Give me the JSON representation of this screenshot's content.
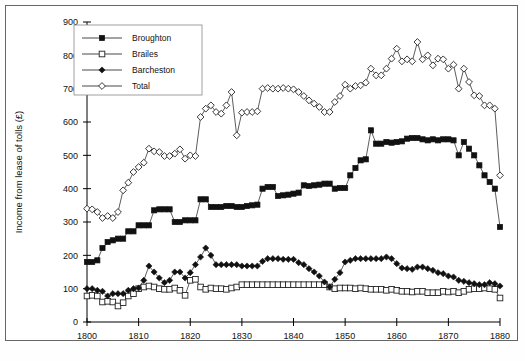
{
  "chart_data": {
    "type": "line",
    "title": "",
    "xlabel": "",
    "ylabel": "Income from lease of tolls (£)",
    "xlim": [
      1800,
      1880
    ],
    "ylim": [
      0,
      900
    ],
    "xticks": [
      1800,
      1810,
      1820,
      1830,
      1840,
      1850,
      1860,
      1870,
      1880
    ],
    "yticks": [
      0,
      100,
      200,
      300,
      400,
      500,
      600,
      700,
      800,
      900
    ],
    "grid": false,
    "legend_position": "top-left",
    "legend": [
      "Broughton",
      "Brailes",
      "Barcheston",
      "Total"
    ],
    "series": [
      {
        "name": "Broughton",
        "marker": "filled-square",
        "x": [
          1800,
          1801,
          1802,
          1803,
          1804,
          1805,
          1806,
          1807,
          1808,
          1809,
          1810,
          1811,
          1812,
          1813,
          1814,
          1815,
          1816,
          1817,
          1818,
          1819,
          1820,
          1821,
          1822,
          1823,
          1824,
          1825,
          1826,
          1827,
          1828,
          1829,
          1830,
          1831,
          1832,
          1833,
          1834,
          1835,
          1836,
          1837,
          1838,
          1839,
          1840,
          1841,
          1842,
          1843,
          1844,
          1845,
          1846,
          1847,
          1848,
          1849,
          1850,
          1851,
          1852,
          1853,
          1854,
          1855,
          1856,
          1857,
          1858,
          1859,
          1860,
          1861,
          1862,
          1863,
          1864,
          1865,
          1866,
          1867,
          1868,
          1869,
          1870,
          1871,
          1872,
          1873,
          1874,
          1875,
          1876,
          1877,
          1878,
          1879,
          1880
        ],
        "y": [
          180,
          180,
          185,
          222,
          240,
          245,
          250,
          250,
          272,
          272,
          290,
          290,
          290,
          335,
          338,
          338,
          338,
          300,
          300,
          305,
          305,
          305,
          368,
          368,
          345,
          345,
          345,
          348,
          348,
          345,
          345,
          348,
          350,
          352,
          400,
          405,
          405,
          378,
          380,
          382,
          385,
          388,
          410,
          408,
          410,
          412,
          415,
          415,
          400,
          402,
          402,
          440,
          462,
          485,
          488,
          575,
          535,
          535,
          540,
          538,
          540,
          542,
          550,
          552,
          552,
          548,
          545,
          548,
          545,
          548,
          548,
          545,
          500,
          540,
          520,
          500,
          470,
          440,
          420,
          400,
          285
        ]
      },
      {
        "name": "Brailes",
        "marker": "open-square",
        "x": [
          1800,
          1801,
          1802,
          1803,
          1804,
          1805,
          1806,
          1807,
          1808,
          1809,
          1810,
          1811,
          1812,
          1813,
          1814,
          1815,
          1816,
          1817,
          1818,
          1819,
          1820,
          1821,
          1822,
          1823,
          1824,
          1825,
          1826,
          1827,
          1828,
          1829,
          1830,
          1831,
          1832,
          1833,
          1834,
          1835,
          1836,
          1837,
          1838,
          1839,
          1840,
          1841,
          1842,
          1843,
          1844,
          1845,
          1846,
          1847,
          1848,
          1849,
          1850,
          1851,
          1852,
          1853,
          1854,
          1855,
          1856,
          1857,
          1858,
          1859,
          1860,
          1861,
          1862,
          1863,
          1864,
          1865,
          1866,
          1867,
          1868,
          1869,
          1870,
          1871,
          1872,
          1873,
          1874,
          1875,
          1876,
          1877,
          1878,
          1879,
          1880
        ],
        "y": [
          78,
          80,
          78,
          60,
          62,
          60,
          48,
          58,
          78,
          85,
          100,
          105,
          108,
          105,
          100,
          98,
          98,
          102,
          95,
          80,
          125,
          128,
          105,
          98,
          102,
          100,
          100,
          98,
          102,
          105,
          112,
          112,
          112,
          112,
          112,
          112,
          112,
          112,
          112,
          112,
          112,
          112,
          112,
          112,
          112,
          112,
          112,
          105,
          100,
          102,
          102,
          102,
          100,
          102,
          100,
          98,
          98,
          98,
          95,
          98,
          95,
          92,
          92,
          90,
          92,
          92,
          88,
          88,
          88,
          92,
          90,
          92,
          88,
          92,
          98,
          100,
          100,
          102,
          100,
          98,
          72
        ]
      },
      {
        "name": "Barcheston",
        "marker": "filled-diamond",
        "x": [
          1800,
          1801,
          1802,
          1803,
          1804,
          1805,
          1806,
          1807,
          1808,
          1809,
          1810,
          1811,
          1812,
          1813,
          1814,
          1815,
          1816,
          1817,
          1818,
          1819,
          1820,
          1821,
          1822,
          1823,
          1824,
          1825,
          1826,
          1827,
          1828,
          1829,
          1830,
          1831,
          1832,
          1833,
          1834,
          1835,
          1836,
          1837,
          1838,
          1839,
          1840,
          1841,
          1842,
          1843,
          1844,
          1845,
          1846,
          1847,
          1848,
          1849,
          1850,
          1851,
          1852,
          1853,
          1854,
          1855,
          1856,
          1857,
          1858,
          1859,
          1860,
          1861,
          1862,
          1863,
          1864,
          1865,
          1866,
          1867,
          1868,
          1869,
          1870,
          1871,
          1872,
          1873,
          1874,
          1875,
          1876,
          1877,
          1878,
          1879,
          1880
        ],
        "y": [
          100,
          100,
          95,
          92,
          78,
          85,
          85,
          85,
          95,
          100,
          102,
          125,
          168,
          150,
          132,
          118,
          125,
          150,
          150,
          132,
          148,
          172,
          195,
          222,
          200,
          172,
          172,
          172,
          172,
          172,
          168,
          168,
          168,
          168,
          182,
          190,
          190,
          190,
          188,
          188,
          188,
          178,
          172,
          160,
          150,
          138,
          120,
          105,
          128,
          148,
          180,
          185,
          190,
          190,
          190,
          190,
          190,
          190,
          195,
          190,
          175,
          162,
          160,
          158,
          165,
          165,
          160,
          155,
          148,
          145,
          138,
          135,
          125,
          122,
          118,
          115,
          112,
          112,
          118,
          115,
          108
        ]
      },
      {
        "name": "Total",
        "marker": "open-diamond",
        "x": [
          1800,
          1801,
          1802,
          1803,
          1804,
          1805,
          1806,
          1807,
          1808,
          1809,
          1810,
          1811,
          1812,
          1813,
          1814,
          1815,
          1816,
          1817,
          1818,
          1819,
          1820,
          1821,
          1822,
          1823,
          1824,
          1825,
          1826,
          1827,
          1828,
          1829,
          1830,
          1831,
          1832,
          1833,
          1834,
          1835,
          1836,
          1837,
          1838,
          1839,
          1840,
          1841,
          1842,
          1843,
          1844,
          1845,
          1846,
          1847,
          1848,
          1849,
          1850,
          1851,
          1852,
          1853,
          1854,
          1855,
          1856,
          1857,
          1858,
          1859,
          1860,
          1861,
          1862,
          1863,
          1864,
          1865,
          1866,
          1867,
          1868,
          1869,
          1870,
          1871,
          1872,
          1873,
          1874,
          1875,
          1876,
          1877,
          1878,
          1879,
          1880
        ],
        "y": [
          340,
          338,
          330,
          312,
          318,
          312,
          330,
          395,
          418,
          450,
          465,
          478,
          520,
          512,
          510,
          498,
          498,
          505,
          518,
          490,
          500,
          498,
          615,
          640,
          650,
          630,
          625,
          650,
          690,
          560,
          628,
          630,
          630,
          632,
          700,
          702,
          700,
          700,
          702,
          700,
          698,
          690,
          678,
          665,
          655,
          645,
          630,
          630,
          660,
          678,
          712,
          700,
          708,
          710,
          718,
          760,
          740,
          740,
          760,
          790,
          820,
          782,
          788,
          782,
          840,
          788,
          800,
          770,
          790,
          788,
          760,
          772,
          700,
          760,
          720,
          680,
          678,
          650,
          650,
          640,
          440
        ]
      }
    ]
  }
}
